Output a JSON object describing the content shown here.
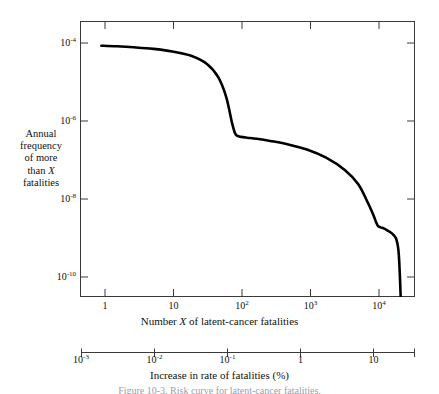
{
  "figure": {
    "caption": "Figure 10-3. Risk curve for latent-cancer fatalities."
  },
  "y_axis": {
    "caption_lines": [
      "Annual",
      "frequency",
      "of more",
      "than X",
      "fatalities"
    ],
    "tick_labels": [
      "10-10",
      "10-8",
      "10-6",
      "10-4"
    ],
    "tick_mantissa": [
      "10",
      "10",
      "10",
      "10"
    ],
    "tick_exponents": [
      "-10",
      "-8",
      "-6",
      "-4"
    ]
  },
  "x_axis": {
    "title_pre": "Number ",
    "title_ital": "X",
    "title_post": " of latent-cancer fatalities",
    "tick_labels": [
      "1",
      "10",
      "10²",
      "10³",
      "10⁴"
    ],
    "tick_mantissa": [
      "1",
      "10",
      "10",
      "10",
      "10"
    ],
    "tick_exponents": [
      "",
      "",
      "2",
      "3",
      "4"
    ]
  },
  "secondary_axis": {
    "title": "Increase in rate of fatalities (%)",
    "tick_mantissa": [
      "10",
      "10",
      "10",
      "1",
      "10"
    ],
    "tick_exponents": [
      "-3",
      "-2",
      "-1",
      "",
      ""
    ]
  },
  "style": {
    "curve_color": "#000000",
    "axis_color": "#3a3a3a",
    "background": "#ffffff"
  },
  "chart_data": {
    "type": "line",
    "title": "",
    "xlabel": "Number X of latent-cancer fatalities",
    "ylabel": "Annual frequency of more than X fatalities",
    "xscale": "log",
    "yscale": "log",
    "xlim": [
      1,
      23000
    ],
    "ylim": [
      1e-10,
      0.000631
    ],
    "grid": false,
    "legend": "none",
    "secondary_xlabel": "Increase in rate of fatalities (%)",
    "secondary_xlim": [
      0.001,
      42
    ],
    "x_major_ticks": [
      1,
      10,
      100,
      1000,
      10000
    ],
    "y_major_ticks": [
      1e-10,
      1e-08,
      1e-06,
      0.0001
    ],
    "secondary_x_major_ticks": [
      0.001,
      0.01,
      0.1,
      1,
      10
    ],
    "series": [
      {
        "name": "Latent-cancer fatality risk curve",
        "x": [
          1.9,
          3,
          5,
          9,
          16,
          28,
          45,
          63,
          80,
          95,
          104,
          112,
          125,
          150,
          200,
          300,
          500,
          900,
          1600,
          2800,
          4200,
          5600,
          6600,
          7200,
          7600,
          8200,
          9000,
          10000,
          11500,
          13000,
          14000,
          14600,
          15000
        ],
        "y": [
          0.000155,
          0.00015,
          0.000142,
          0.00013,
          0.000112,
          8.8e-05,
          5.5e-05,
          2.6e-05,
          8.5e-06,
          2e-06,
          1.1e-06,
          9.3e-07,
          8.8e-07,
          8.4e-07,
          7.9e-07,
          7e-07,
          5.8e-07,
          4.3e-07,
          2.7e-07,
          1.35e-07,
          6e-08,
          2.1e-08,
          1.05e-08,
          6.8e-09,
          5.6e-09,
          5.2e-09,
          4.9e-09,
          4.4e-09,
          3.7e-09,
          2.8e-09,
          1.4e-09,
          3.5e-10,
          9e-11
        ]
      }
    ]
  }
}
